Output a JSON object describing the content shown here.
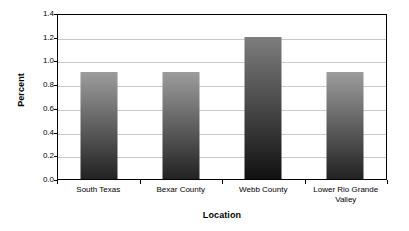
{
  "chart_data": {
    "type": "bar",
    "title": "",
    "subtitle": "",
    "xlabel": "Location",
    "ylabel": "Percent",
    "categories": [
      "South Texas",
      "Bexar County",
      "Webb County",
      "Lower Rio Grande Valley"
    ],
    "values": [
      0.9,
      0.9,
      1.2,
      0.9
    ],
    "ylim": [
      0.0,
      1.4
    ],
    "ytick_values": [
      0.0,
      0.2,
      0.4,
      0.6,
      0.8,
      1.0,
      1.2,
      1.4
    ],
    "ytick_labels": [
      "0.0",
      "0.2",
      "0.4",
      "0.6",
      "0.8",
      "1.0",
      "1.2",
      "1.4"
    ],
    "grid": "horizontal",
    "legend": "none",
    "annotations": [],
    "series": [
      {
        "name": "Percent",
        "values": [
          0.9,
          0.9,
          1.2,
          0.9
        ]
      }
    ],
    "bar_style": {
      "gradient_top_color": "#9d9d9d",
      "gradient_bottom_color": "#222222",
      "dark_gradient_top_color": "#7d7d7d",
      "dark_gradient_bottom_color": "#111111",
      "darker_bar_index": 2
    },
    "axis_color": "#000000",
    "gridline_color": "#c8c8c8",
    "background_color": "#ffffff"
  }
}
